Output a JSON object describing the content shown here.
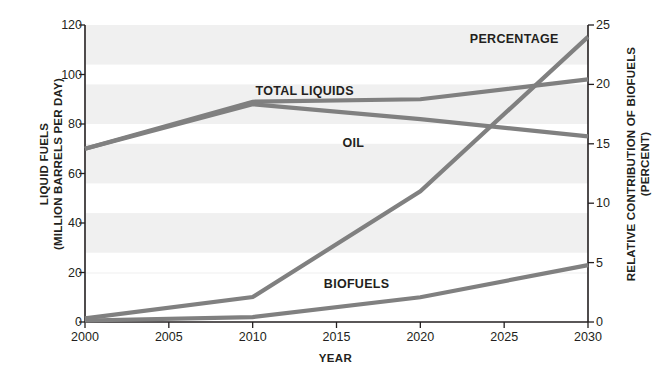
{
  "chart_data": {
    "type": "line",
    "title": "",
    "xlabel": "YEAR",
    "ylabel": "LIQUID FUELS\n(MILLION BARRELS PER DAY)",
    "y2label": "RELATIVE CONTRIBUTION OF BIOFUELS\n(PERCENT)",
    "x": [
      2000,
      2005,
      2010,
      2015,
      2020,
      2025,
      2030
    ],
    "xlim": [
      2000,
      2030
    ],
    "ylim": [
      0,
      120
    ],
    "y2lim": [
      0,
      25
    ],
    "xticks": [
      "2000",
      "2005",
      "2010",
      "2015",
      "2020",
      "2025",
      "2030"
    ],
    "yticks": [
      "0",
      "20",
      "40",
      "60",
      "80",
      "100",
      "120"
    ],
    "y2ticks": [
      "0",
      "5",
      "10",
      "15",
      "20",
      "25"
    ],
    "grid": false,
    "banded_background": true,
    "legend": "inline-labels",
    "line_color": "#808080",
    "axis_color": "#231f20",
    "band_color": "#f0f0f0",
    "series": [
      {
        "name": "TOTAL LIQUIDS",
        "axis": "left",
        "label_x": 2013.1,
        "label_y": 93,
        "points": [
          {
            "x": 2000,
            "y": 70
          },
          {
            "x": 2010,
            "y": 89
          },
          {
            "x": 2020,
            "y": 90
          },
          {
            "x": 2030,
            "y": 98
          }
        ]
      },
      {
        "name": "OIL",
        "axis": "left",
        "label_x": 2016.0,
        "label_y": 72,
        "points": [
          {
            "x": 2000,
            "y": 70
          },
          {
            "x": 2010,
            "y": 88
          },
          {
            "x": 2020,
            "y": 82
          },
          {
            "x": 2030,
            "y": 75
          }
        ]
      },
      {
        "name": "BIOFUELS",
        "axis": "left",
        "label_x": 2016.2,
        "label_y": 15,
        "points": [
          {
            "x": 2000,
            "y": 0.6
          },
          {
            "x": 2010,
            "y": 2
          },
          {
            "x": 2020,
            "y": 10
          },
          {
            "x": 2030,
            "y": 23
          }
        ]
      },
      {
        "name": "PERCENTAGE",
        "axis": "right",
        "label_x": 2025.6,
        "label_y": 23.7,
        "points": [
          {
            "x": 2000,
            "y": 0.3
          },
          {
            "x": 2010,
            "y": 2.1
          },
          {
            "x": 2020,
            "y": 11.0
          },
          {
            "x": 2030,
            "y": 24.0
          }
        ]
      }
    ],
    "background_bands": [
      {
        "from_y": 120,
        "to_y": 104
      },
      {
        "from_y": 96,
        "to_y": 80
      },
      {
        "from_y": 72,
        "to_y": 56
      },
      {
        "from_y": 44,
        "to_y": 28
      },
      {
        "from_y": 20,
        "to_y": 20
      }
    ]
  }
}
